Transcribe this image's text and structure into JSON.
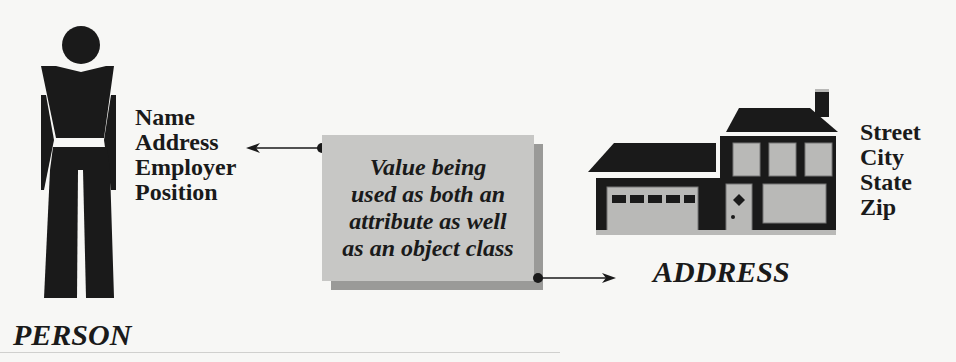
{
  "person": {
    "caption": "PERSON",
    "attributes": [
      "Name",
      "Address",
      "Employer",
      "Position"
    ],
    "icon": "person-icon"
  },
  "note": {
    "lines": [
      "Value being",
      "used as both an",
      "attribute as well",
      "as an object class"
    ]
  },
  "address": {
    "caption": "ADDRESS",
    "attributes": [
      "Street",
      "City",
      "State",
      "Zip"
    ],
    "icon": "house-icon"
  },
  "colors": {
    "ink": "#1a1a1a",
    "note_fill": "#c7c7c5",
    "note_shadow": "#9a9a98",
    "house_fill": "#b9b9b7",
    "background": "#f7f7f5"
  }
}
